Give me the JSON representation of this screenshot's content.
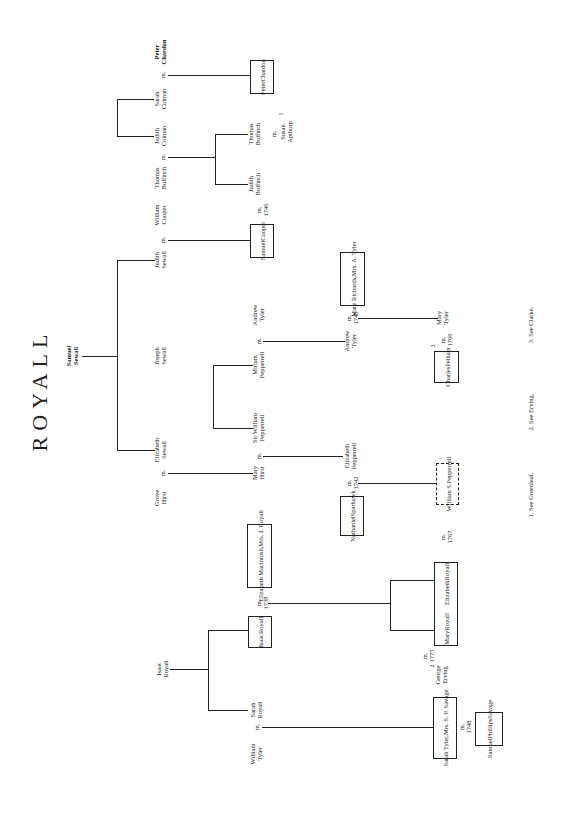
{
  "title": "ROYALL",
  "people": {
    "samuel_sewall": [
      "Samuel",
      "Sewall"
    ],
    "judith_sewall": [
      "Judith",
      "Sewall"
    ],
    "joseph_sewall": [
      "Joseph",
      "Sewall"
    ],
    "elizabeth_sewall": [
      "Elizabeth",
      "Sewall"
    ],
    "william_cooper": [
      "William",
      "Cooper"
    ],
    "samuel_cooper": [
      "Samuel",
      "Cooper"
    ],
    "grove_hirst": [
      "Grove",
      "Hirst"
    ],
    "mary_hirst": [
      "Mary",
      "Hirst"
    ],
    "sir_william_pepperrell": [
      "Sir William",
      "Pepperrell"
    ],
    "miriam_pepperrell": [
      "Miriam",
      "Pepperrell"
    ],
    "andrew_tyler": [
      "Andrew",
      "Tyler"
    ],
    "andrew_tyler_2": [
      "Andrew",
      "Tyler"
    ],
    "mary_richards": [
      "Mary Richards,",
      "Mrs. A. Tyler"
    ],
    "mary_tyler": [
      "Mary",
      "Tyler"
    ],
    "charles_pelham": [
      "Charles",
      "Pelham"
    ],
    "elizabeth_pepperrell": [
      "Elizabeth",
      "Pepperrell"
    ],
    "nathaniel_sparhawk": [
      "Nathaniel",
      "Sparhawk"
    ],
    "william_s_pepperrell": [
      "William S.",
      "Pepperrell"
    ],
    "thomas_bulfinch": [
      "Thomas",
      "Bulfinch"
    ],
    "judith_colman": [
      "Judith",
      "Colman"
    ],
    "sarah_colman": [
      "Sarah",
      "Colman"
    ],
    "peter_chardon": [
      "Peter",
      "Chardon"
    ],
    "peter_chardon_2": [
      "Peter",
      "Chardon"
    ],
    "judith_bulfinch": [
      "Judith",
      "Bulfinch"
    ],
    "thomas_bulfinch_2": [
      "Thomas",
      "Bulfinch"
    ],
    "susan_apthorp": [
      "Susan",
      "Apthorp"
    ],
    "isaac_royall": [
      "Isaac",
      "Royall"
    ],
    "isaac_royall_2": [
      "Isaac",
      "Royall"
    ],
    "elizabeth_mackintosh": [
      "Elizabeth Macintosh,",
      "Mrs. I. Royall"
    ],
    "mary_royall": [
      "Mary",
      "Royall"
    ],
    "elizabeth_royall": [
      "Elizabeth",
      "Royall"
    ],
    "george_erving": [
      "George",
      "Erving"
    ],
    "sarah_royall": [
      "Sarah",
      "Royall"
    ],
    "william_tyler": [
      "William",
      "Tyler"
    ],
    "sarah_tyler": [
      "Sarah Tyler,",
      "Mrs. S. P. Savage"
    ],
    "samuel_phillips_savage": [
      "Samuel",
      "Phillips",
      "Savage"
    ]
  },
  "marriages": {
    "m": "m.",
    "cooper_1746": "1746",
    "tyler_1748": "1748",
    "pelham_1766": "1766",
    "sparhawk_1742": "1742",
    "pepperrell_1767": "1767",
    "royall_1738": "1738",
    "erving_1775": "1775",
    "savage_1748": "1748"
  },
  "superscripts": {
    "one": "1",
    "two": "2",
    "three": "3"
  },
  "footnotes": [
    "1. See Greenleaf.",
    "2. See Erving.",
    "3. See Clarke."
  ]
}
